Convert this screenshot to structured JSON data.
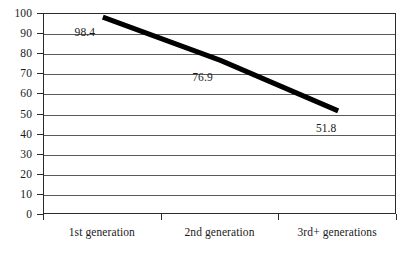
{
  "chart_data": {
    "type": "line",
    "title": "",
    "subtitle": "",
    "xlabel": "",
    "ylabel": "",
    "categories": [
      "1st generation",
      "2nd generation",
      "3rd+ generations"
    ],
    "values": [
      98.4,
      76.9,
      51.8
    ],
    "series": [
      {
        "name": "",
        "values": [
          98.4,
          76.9,
          51.8
        ]
      }
    ],
    "data_labels": [
      "98.4",
      "76.9",
      "51.8"
    ],
    "ylim": [
      0,
      100
    ],
    "y_tick_step": 10,
    "y_ticks": [
      100,
      90,
      80,
      70,
      60,
      50,
      40,
      30,
      20,
      10,
      0
    ],
    "y_tick_labels": [
      "100",
      "90",
      "80",
      "70",
      "60",
      "50",
      "40",
      "30",
      "20",
      "10",
      "0"
    ],
    "grid": true,
    "grid_axis": "y",
    "legend": false,
    "legend_position": "none",
    "annotations": [],
    "colors": {
      "line": "#000000",
      "grid": "#5a5a5a",
      "axis": "#2b2b2b",
      "background": "#ffffff",
      "text": "#1a1a1a"
    },
    "line_width_px": 5
  }
}
